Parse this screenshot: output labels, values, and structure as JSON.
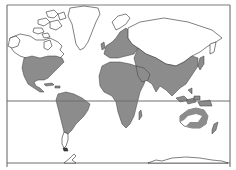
{
  "map": {
    "projection": "Mercator world map",
    "style": "outline map with shaded distribution range",
    "colors": {
      "background": "#ffffff",
      "land_unshaded": "#ffffff",
      "land_outline": "#2b2b2b",
      "range_fill": "#8c8c8c",
      "frame": "#7a7a7a"
    },
    "reference_lines": [
      {
        "name": "equator"
      },
      {
        "name": "southern-parallel"
      }
    ],
    "shaded_regions": [
      "North America (USA, southern Canada, Mexico, Central America, Caribbean)",
      "South America (except southern tip)",
      "Europe",
      "Africa",
      "Asia south of Siberia incl. China, India, SE Asia, Japan",
      "Indonesia / New Guinea",
      "Australia (coastal rim)",
      "New Zealand"
    ],
    "unshaded_regions": [
      "Alaska & northern Canada",
      "Arctic archipelago",
      "Greenland",
      "Northern Russia / Siberia",
      "Southern tip of South America",
      "Interior Australia",
      "Antarctica"
    ]
  }
}
